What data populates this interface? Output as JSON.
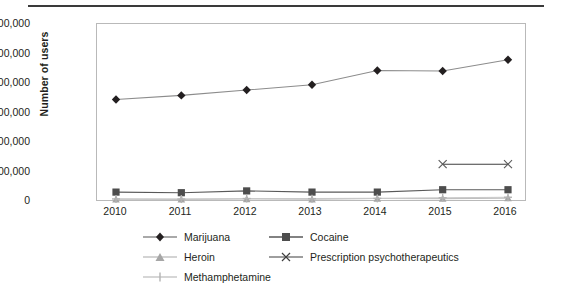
{
  "chart_data": {
    "type": "line",
    "title": "",
    "xlabel": "",
    "ylabel": "Number of users",
    "x": [
      2010,
      2011,
      2012,
      2013,
      2014,
      2015,
      2016
    ],
    "xtick_labels": [
      "2010",
      "2011",
      "2012",
      "2013",
      "2014",
      "2015",
      "2016"
    ],
    "ytick_labels": [
      "30,000,000",
      "25,000,000",
      "20,000,000",
      "15,000,000",
      "10,000,000",
      "5,000,000",
      "0"
    ],
    "ytick_values": [
      30000000,
      25000000,
      20000000,
      15000000,
      10000000,
      5000000,
      0
    ],
    "ylim": [
      0,
      30000000
    ],
    "grid": false,
    "legend_position": "bottom",
    "series": [
      {
        "name": "Marijuana",
        "marker": "diamond",
        "color": "#231f20",
        "line_color": "#8c8c8c",
        "values": [
          17100000,
          17800000,
          18700000,
          19600000,
          22000000,
          21900000,
          23800000
        ]
      },
      {
        "name": "Cocaine",
        "marker": "square",
        "color": "#4d4d4d",
        "line_color": "#595959",
        "values": [
          1500000,
          1400000,
          1700000,
          1500000,
          1500000,
          1900000,
          1900000
        ]
      },
      {
        "name": "Heroin",
        "marker": "triangle",
        "color": "#a6a6a6",
        "line_color": "#bfbfbf",
        "values": [
          290000,
          280000,
          330000,
          290000,
          430000,
          400000,
          480000
        ]
      },
      {
        "name": "Prescription psychotherapeutics",
        "marker": "cross",
        "color": "#5a5a5a",
        "line_color": "#3f3f3f",
        "values": [
          null,
          null,
          null,
          null,
          null,
          6200000,
          6200000
        ]
      },
      {
        "name": "Methamphetamine",
        "marker": "plus",
        "color": "#b3b3b3",
        "line_color": "#c9c9c9",
        "values": [
          350000,
          330000,
          420000,
          400000,
          440000,
          550000,
          630000
        ]
      }
    ]
  },
  "axis": {
    "y_title": "Number of users"
  },
  "legend": {
    "items": [
      {
        "label": "Marijuana"
      },
      {
        "label": "Cocaine"
      },
      {
        "label": "Heroin"
      },
      {
        "label": "Prescription psychotherapeutics"
      },
      {
        "label": "Methamphetamine"
      }
    ]
  }
}
